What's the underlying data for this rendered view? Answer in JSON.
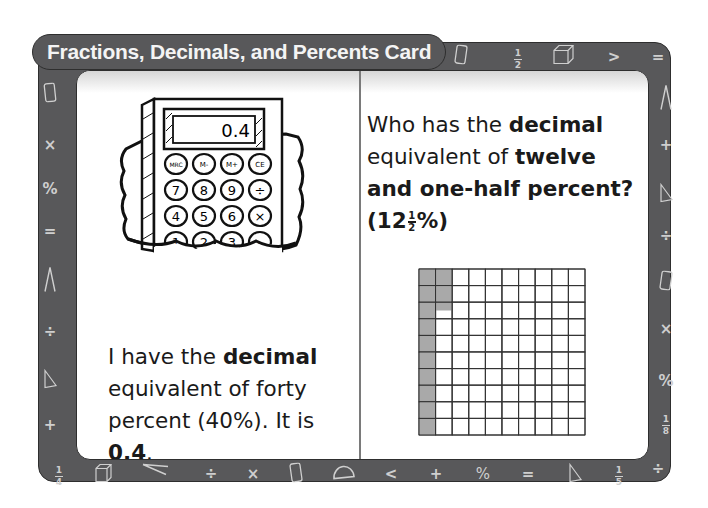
{
  "card": {
    "title": "Fractions, Decimals, and Percents Card",
    "frame_color": "#58585a",
    "symbol_color": "#cfcfcf"
  },
  "left_panel": {
    "calculator": {
      "display": "0.4",
      "keys_row1": [
        "MRC",
        "M-",
        "M+",
        "CE"
      ],
      "keys_row2": [
        "7",
        "8",
        "9",
        "÷"
      ],
      "keys_row3": [
        "4",
        "5",
        "6",
        "×"
      ],
      "keys_row4": [
        "1",
        "2",
        "3",
        "-"
      ]
    },
    "statement": {
      "part1": "I have the ",
      "bold1": "decimal",
      "part2": " equivalent of forty percent (40%). It is ",
      "bold2": "0.4",
      "part3": "."
    }
  },
  "right_panel": {
    "question": {
      "part1": "Who has the ",
      "bold1": "decimal",
      "part2": " equivalent of ",
      "bold2": "twelve and one-half percent? (12",
      "frac_num": "1",
      "frac_den": "2",
      "bold3": "%)"
    },
    "hundred_grid": {
      "rows": 10,
      "cols": 10,
      "shaded_squares": 12.5,
      "shade_color": "#a9a9a9"
    }
  },
  "border_symbols": {
    "top": [
      "÷",
      "cylinder",
      "1/2",
      "cube",
      ">",
      "="
    ],
    "left": [
      "cylinder",
      "×",
      "%",
      "=",
      "compass",
      "÷",
      "triangle",
      "+"
    ],
    "right": [
      "compass",
      "+",
      "triangle",
      "÷",
      "cylinder",
      "×",
      "%",
      "1/8",
      "÷"
    ],
    "bottom": [
      "1/4",
      "cube",
      "compass",
      "÷",
      "×",
      "cylinder",
      "protractor",
      "<",
      "+",
      "%",
      "=",
      "triangle",
      "1/5"
    ]
  }
}
